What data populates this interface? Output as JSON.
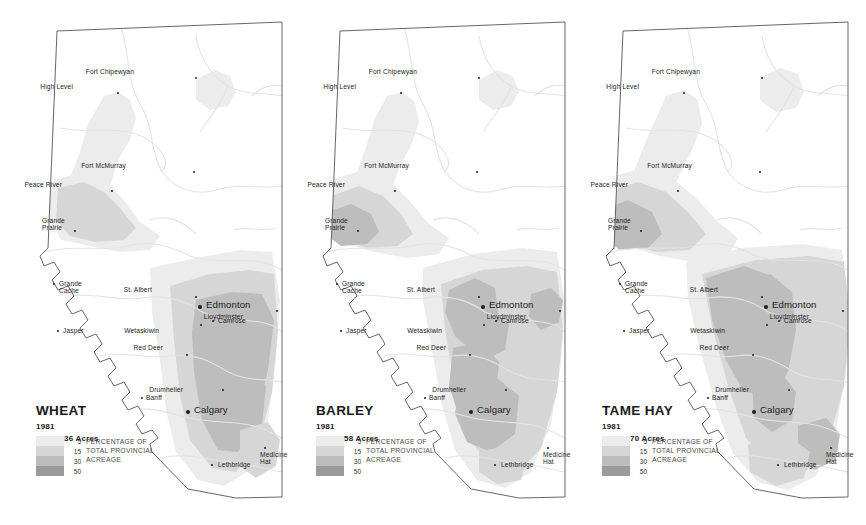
{
  "figure": {
    "kind": "choropleth-map-series",
    "region": "Alberta",
    "panel_count": 3
  },
  "legend": {
    "values": [
      "5",
      "15",
      "30",
      "50"
    ],
    "caption_lines": [
      "PERCENTAGE OF",
      "TOTAL PROVINCIAL",
      "ACREAGE"
    ],
    "swatch_colors": [
      "#ececec",
      "#d6d6d6",
      "#bdbdbd",
      "#9a9a9a"
    ]
  },
  "colors": {
    "class_5": "#ececec",
    "class_15": "#d6d6d6",
    "class_30": "#bdbdbd",
    "class_50": "#9a9a9a",
    "base": "#ffffff",
    "outline": "#555555",
    "river": "#e3e3e3",
    "text": "#1b1b1b"
  },
  "panels": [
    {
      "id": "wheat",
      "crop": "WHEAT",
      "year": "1981",
      "acres": "6,705,436 Acres"
    },
    {
      "id": "barley",
      "crop": "BARLEY",
      "year": "1981",
      "acres": "6,432,958 Acres"
    },
    {
      "id": "tame-hay",
      "crop": "TAME HAY",
      "year": "1981",
      "acres": "3,480,670 Acres"
    }
  ],
  "cities": [
    {
      "name": "Fort Chipewyan",
      "key": "fort-chipewyan",
      "x": 196,
      "y": 78,
      "dx": -62,
      "dy": -10,
      "size": "small",
      "dot": 2.6
    },
    {
      "name": "High Level",
      "key": "high-level",
      "x": 118,
      "y": 93,
      "dx": -45,
      "dy": -10,
      "size": "small",
      "dot": 2.6
    },
    {
      "name": "Fort McMurray",
      "key": "fort-mcmurray",
      "x": 194,
      "y": 172,
      "dx": -68,
      "dy": -10,
      "size": "small",
      "dot": 2.6
    },
    {
      "name": "Peace River",
      "key": "peace-river",
      "x": 112,
      "y": 191,
      "dx": -50,
      "dy": -10,
      "size": "small",
      "dot": 2.6
    },
    {
      "name": "Grande\nPrairie",
      "key": "grande-prairie",
      "x": 75,
      "y": 231,
      "dx": -33,
      "dy": -14,
      "size": "small",
      "dot": 2.6
    },
    {
      "name": "Grande\nCache",
      "key": "grande-cache",
      "x": 54,
      "y": 284,
      "dx": 5,
      "dy": -4,
      "size": "small",
      "dot": 2.2
    },
    {
      "name": "Jasper",
      "key": "jasper",
      "x": 58,
      "y": 331,
      "dx": 5,
      "dy": -4,
      "size": "small",
      "dot": 2.2
    },
    {
      "name": "St. Albert",
      "key": "st-albert",
      "x": 196,
      "y": 297,
      "dx": -44,
      "dy": -11,
      "size": "small",
      "dot": 2.6
    },
    {
      "name": "Edmonton",
      "key": "edmonton",
      "x": 200,
      "y": 307,
      "dx": 6,
      "dy": -6,
      "size": "big",
      "dot": 4.4
    },
    {
      "name": "Lloydminster",
      "key": "lloydminster",
      "x": 277,
      "y": 311,
      "dx": -34,
      "dy": 2,
      "size": "small",
      "dot": 2.6
    },
    {
      "name": "Camrose",
      "key": "camrose",
      "x": 213,
      "y": 321,
      "dx": 5,
      "dy": -4,
      "size": "small",
      "dot": 2.6
    },
    {
      "name": "Wetaskiwin",
      "key": "wetaskiwin",
      "x": 201,
      "y": 325,
      "dx": -42,
      "dy": 2,
      "size": "small",
      "dot": 2.6
    },
    {
      "name": "Red Deer",
      "key": "red-deer",
      "x": 187,
      "y": 355,
      "dx": -24,
      "dy": -11,
      "size": "small",
      "dot": 2.6
    },
    {
      "name": "Drumheller",
      "key": "drumheller",
      "x": 223,
      "y": 390,
      "dx": -40,
      "dy": -4,
      "size": "small",
      "dot": 2.6
    },
    {
      "name": "Banff",
      "key": "banff",
      "x": 142,
      "y": 398,
      "dx": 4,
      "dy": -4,
      "size": "small",
      "dot": 2.4
    },
    {
      "name": "Calgary",
      "key": "calgary",
      "x": 188,
      "y": 412,
      "dx": 6,
      "dy": -6,
      "size": "big",
      "dot": 4.4
    },
    {
      "name": "Medicine\nHat",
      "key": "medicine-hat",
      "x": 265,
      "y": 448,
      "dx": -5,
      "dy": 3,
      "size": "small",
      "dot": 2.6
    },
    {
      "name": "Lethbridge",
      "key": "lethbridge",
      "x": 212,
      "y": 465,
      "dx": 6,
      "dy": -4,
      "size": "small",
      "dot": 2.6
    }
  ],
  "shading": {
    "wheat": [
      {
        "class": "class_5",
        "d": "M104,96 L118,92 L130,100 L136,118 L130,140 L118,160 L110,186 L103,205 L92,214 L78,217 L66,212 L62,198 L70,178 L80,152 L88,124 Z"
      },
      {
        "class": "class_5",
        "d": "M196,80 L214,70 L230,76 L236,92 L228,106 L210,110 L196,100 Z"
      },
      {
        "class": "class_5",
        "d": "M55,180 L82,172 L104,180 L122,198 L140,222 L160,236 L150,250 L120,252 L90,246 L62,240 L50,222 L48,198 Z"
      },
      {
        "class": "class_15",
        "d": "M58,188 L84,182 L104,192 L120,208 L136,228 L124,240 L96,242 L70,236 L56,220 Z"
      },
      {
        "class": "class_5",
        "d": "M150,268 L196,258 L240,250 L272,252 L280,300 L276,360 L268,420 L250,470 L224,486 L198,480 L176,452 L166,410 L160,360 L152,312 Z"
      },
      {
        "class": "class_15",
        "d": "M170,286 L210,274 L250,270 L274,274 L278,330 L272,392 L258,446 L236,472 L212,468 L190,440 L180,396 L174,340 Z"
      },
      {
        "class": "class_30",
        "d": "M196,300 L232,292 L262,294 L274,320 L268,370 L256,420 L238,452 L218,450 L202,420 L194,372 L192,332 Z"
      },
      {
        "class": "class_30",
        "d": "M210,380 L246,372 L266,386 L262,424 L240,450 L216,444 L206,412 Z"
      },
      {
        "class": "class_15",
        "d": "M240,430 L268,422 L280,440 L276,466 L256,478 L240,466 Z"
      }
    ],
    "barley": [
      {
        "class": "class_5",
        "d": "M104,96 L120,92 L132,102 L136,122 L128,146 L116,168 L108,192 L98,210 L84,216 L70,210 L66,194 L74,172 L84,144 L92,118 Z"
      },
      {
        "class": "class_5",
        "d": "M196,80 L214,70 L230,76 L236,92 L228,106 L210,110 L196,100 Z"
      },
      {
        "class": "class_5",
        "d": "M48,180 L80,170 L106,180 L126,200 L146,224 L166,238 L156,254 L124,258 L92,252 L62,244 L46,224 Z"
      },
      {
        "class": "class_15",
        "d": "M48,196 L76,186 L100,196 L118,214 L130,234 L114,246 L84,248 L58,240 L44,222 Z"
      },
      {
        "class": "class_30",
        "d": "M44,212 L68,204 L88,214 L96,232 L84,244 L58,246 L42,234 Z"
      },
      {
        "class": "class_5",
        "d": "M140,268 L190,254 L240,248 L274,252 L282,304 L278,364 L268,424 L248,472 L222,488 L194,480 L172,450 L158,402 L148,344 L140,300 Z"
      },
      {
        "class": "class_15",
        "d": "M158,284 L200,270 L244,266 L274,272 L280,330 L274,392 L258,448 L234,474 L208,468 L186,438 L172,388 L162,330 Z"
      },
      {
        "class": "class_30",
        "d": "M166,290 L192,278 L212,288 L216,318 L208,346 L190,352 L172,336 L162,312 Z"
      },
      {
        "class": "class_30",
        "d": "M184,316 L208,310 L226,324 L222,350 L202,360 L184,346 Z"
      },
      {
        "class": "class_30",
        "d": "M170,348 L198,342 L216,362 L212,400 L196,424 L176,416 L166,386 Z"
      },
      {
        "class": "class_30",
        "d": "M176,384 L214,378 L236,396 L232,434 L208,452 L184,442 L172,414 Z"
      },
      {
        "class": "class_30",
        "d": "M248,294 L268,288 L280,300 L276,322 L258,330 L246,316 Z"
      },
      {
        "class": "class_15",
        "d": "M196,452 L230,444 L244,460 L238,480 L214,484 L196,472 Z"
      }
    ],
    "tame_hay": [
      {
        "class": "class_5",
        "d": "M100,96 L118,90 L132,100 L136,124 L126,150 L114,174 L104,198 L92,214 L76,218 L62,210 L60,192 L70,166 L82,136 L92,114 Z"
      },
      {
        "class": "class_5",
        "d": "M194,78 L214,68 L232,74 L238,92 L230,108 L210,112 L194,100 Z"
      },
      {
        "class": "class_5",
        "d": "M42,178 L76,168 L106,178 L130,198 L152,222 L172,238 L162,256 L128,262 L94,256 L60,246 L40,226 Z"
      },
      {
        "class": "class_15",
        "d": "M42,192 L72,182 L100,192 L122,212 L140,234 L124,250 L90,252 L56,242 L38,222 Z"
      },
      {
        "class": "class_30",
        "d": "M36,210 L62,200 L86,212 L96,234 L82,248 L54,250 L34,236 Z"
      },
      {
        "class": "class_5",
        "d": "M120,262 L176,248 L236,244 L276,250 L284,310 L280,372 L270,430 L250,476 L222,490 L192,482 L166,452 L148,400 L132,342 L122,298 Z"
      },
      {
        "class": "class_15",
        "d": "M136,274 L190,260 L244,256 L278,262 L284,324 L278,386 L262,444 L236,476 L206,470 L180,438 L162,386 L146,326 Z"
      },
      {
        "class": "class_30",
        "d": "M140,278 L178,266 L206,276 L218,300 L214,334 L206,368 L196,394 L178,392 L160,360 L146,320 Z"
      },
      {
        "class": "class_30",
        "d": "M162,286 L204,274 L226,292 L230,330 L222,372 L206,398 L186,392 L170,356 L160,318 Z"
      },
      {
        "class": "class_30",
        "d": "M186,382 L216,374 L230,392 L226,420 L206,432 L188,418 Z"
      },
      {
        "class": "class_30",
        "d": "M232,426 L260,418 L274,434 L270,460 L248,470 L232,454 Z"
      },
      {
        "class": "class_15",
        "d": "M182,444 L222,436 L244,452 L238,478 L210,486 L184,472 Z"
      }
    ]
  }
}
